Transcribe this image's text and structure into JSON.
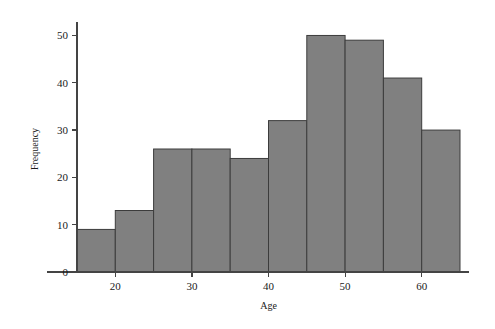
{
  "chart_data": {
    "type": "bar",
    "title": "",
    "subtitle": "",
    "xlabel": "Age",
    "ylabel": "Frequency",
    "bin_width": 5,
    "bin_start": 15,
    "bin_edges": [
      15,
      20,
      25,
      30,
      35,
      40,
      45,
      50,
      55,
      60,
      65
    ],
    "categories": [
      "15-20",
      "20-25",
      "25-30",
      "30-35",
      "35-40",
      "40-45",
      "45-50",
      "50-55",
      "55-60",
      "60-65"
    ],
    "values": [
      9,
      13,
      26,
      26,
      24,
      32,
      50,
      49,
      41,
      30
    ],
    "xlim": [
      15,
      65
    ],
    "ylim": [
      0,
      52
    ],
    "xticks": [
      20,
      30,
      40,
      50,
      60
    ],
    "xtick_labels": [
      "20",
      "30",
      "40",
      "50",
      "60"
    ],
    "yticks": [
      0,
      10,
      20,
      30,
      40,
      50
    ],
    "ytick_labels": [
      "0",
      "10",
      "20",
      "30",
      "40",
      "50"
    ],
    "grid": false,
    "legend": "none",
    "bar_fill_color": "#808080",
    "bar_edge_color": "#3c3c3c",
    "axis_color": "#444444",
    "background_color": "#ffffff"
  }
}
